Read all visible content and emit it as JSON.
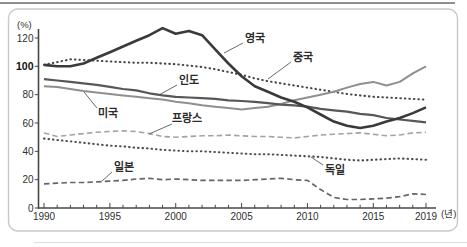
{
  "chart_data": {
    "type": "line",
    "title": "",
    "y_unit": "(%)",
    "x_unit": "(년)",
    "grid": false,
    "legend": "inline-labels",
    "x_start": 1990,
    "x_end": 2019,
    "ylim": [
      0,
      126
    ],
    "x_tick_labels": [
      1990,
      1995,
      2000,
      2005,
      2010,
      2015,
      2019
    ],
    "y_ticks": [
      0,
      20,
      40,
      60,
      80,
      100,
      120
    ],
    "y_tick_bold": 100,
    "years": [
      1990,
      1991,
      1992,
      1993,
      1994,
      1995,
      1996,
      1997,
      1998,
      1999,
      2000,
      2001,
      2002,
      2003,
      2004,
      2005,
      2006,
      2007,
      2008,
      2009,
      2010,
      2011,
      2012,
      2013,
      2014,
      2015,
      2016,
      2017,
      2018,
      2019
    ],
    "series": [
      {
        "id": "uk",
        "name": "영국",
        "line": "solid",
        "color": "#3a3a3a",
        "width": 2.6,
        "values": [
          101,
          100,
          100,
          102,
          106,
          110,
          114,
          118,
          122,
          127,
          123,
          125,
          122,
          112,
          102,
          93,
          86,
          82,
          78,
          75,
          71,
          66,
          61,
          58,
          56.5,
          58,
          61,
          63.5,
          67,
          71
        ],
        "label_x": 255,
        "label_y": 38,
        "ptr": [
          243,
          43,
          224,
          53
        ]
      },
      {
        "id": "china",
        "name": "중국",
        "line": "dotted",
        "color": "#474747",
        "width": 2.1,
        "values": [
          101,
          103,
          105,
          104.5,
          104,
          103.5,
          103,
          102.5,
          102.5,
          102,
          101.5,
          100.5,
          99.5,
          98,
          96,
          94,
          91.5,
          89.5,
          88,
          86.5,
          85,
          83.5,
          82,
          80.5,
          79.5,
          78.5,
          78,
          77.5,
          77,
          76.5
        ],
        "label_x": 303,
        "label_y": 57,
        "ptr": [
          291,
          62,
          268,
          79
        ]
      },
      {
        "id": "india",
        "name": "인도",
        "line": "solid",
        "color": "#575757",
        "width": 2.2,
        "values": [
          91,
          90,
          89,
          88,
          87,
          85.5,
          84,
          83,
          81,
          79.5,
          78.5,
          78,
          77.5,
          77,
          76,
          75.5,
          75,
          74,
          73,
          72.5,
          71.5,
          70,
          69,
          68,
          66.5,
          65.5,
          63.5,
          62.5,
          61.5,
          60.5
        ],
        "label_x": 189,
        "label_y": 80,
        "ptr": [
          177,
          85,
          159,
          95
        ]
      },
      {
        "id": "usa",
        "name": "미국",
        "line": "solid",
        "color": "#8f8f8f",
        "width": 2,
        "values": [
          86,
          85.5,
          84,
          82.5,
          81.5,
          80.5,
          79.5,
          78.5,
          77.5,
          76.5,
          75,
          74,
          72.5,
          71.5,
          70.5,
          69.5,
          70.5,
          71.5,
          73.5,
          76,
          78,
          80,
          82,
          85,
          87.5,
          89,
          86.5,
          89,
          95,
          100
        ],
        "label_x": 108,
        "label_y": 113,
        "ptr": [
          97,
          108,
          84,
          92
        ]
      },
      {
        "id": "france",
        "name": "프랑스",
        "line": "dashed",
        "color": "#a3a3a3",
        "width": 1.6,
        "values": [
          53,
          50.5,
          51.5,
          52.5,
          53.5,
          54,
          54.5,
          54,
          52.5,
          50.5,
          50,
          50.5,
          51,
          51,
          51.5,
          51,
          50.5,
          50.5,
          50,
          49.5,
          50.5,
          51.5,
          52,
          52.5,
          53,
          52,
          51,
          51.5,
          53,
          53.5
        ],
        "label_x": 187,
        "label_y": 118,
        "ptr": [
          172,
          124,
          149,
          134
        ]
      },
      {
        "id": "germany",
        "name": "독일",
        "line": "dotted",
        "color": "#4f4f4f",
        "width": 2.1,
        "values": [
          49,
          48,
          47,
          46,
          45,
          44,
          43.5,
          42.5,
          42,
          41,
          40.5,
          40,
          40,
          39.5,
          39,
          38.5,
          38,
          38,
          37.5,
          37,
          36.5,
          36,
          35,
          34,
          33.5,
          34,
          34.5,
          35,
          34.5,
          34
        ],
        "label_x": 335,
        "label_y": 170,
        "ptr": [
          323,
          165,
          311,
          157
        ]
      },
      {
        "id": "japan",
        "name": "일본",
        "line": "dashed",
        "color": "#666666",
        "width": 1.7,
        "values": [
          17,
          17.5,
          18,
          18,
          18.5,
          19,
          19.5,
          20.5,
          21,
          20,
          20.5,
          20,
          19.5,
          19.5,
          19.5,
          19.5,
          20,
          20.5,
          21,
          20,
          19.5,
          13,
          7.5,
          6,
          6,
          6.5,
          7,
          8,
          10,
          9.5
        ],
        "label_x": 124,
        "label_y": 167,
        "ptr": [
          112,
          172,
          102,
          181
        ]
      }
    ]
  }
}
